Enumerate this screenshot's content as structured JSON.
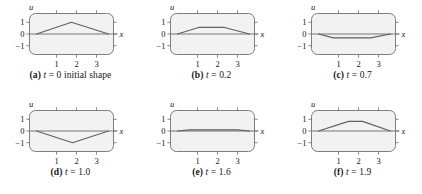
{
  "figure": {
    "title": "",
    "panel_count": 6,
    "columns": 3,
    "rows": 2
  },
  "axes": {
    "ylabel": "u",
    "xlabel": "x",
    "ytick_labels": [
      "1",
      "0",
      "−1"
    ],
    "ytick_values": [
      1,
      0,
      -1
    ],
    "xtick_labels": [
      "1",
      "2",
      "3"
    ],
    "xtick_values": [
      1,
      2,
      3
    ],
    "xlim": [
      -0.35,
      3.85
    ],
    "ylim": [
      -1.75,
      1.75
    ],
    "grid": false,
    "frame_fill": "#f2f2f2",
    "frame_stroke": "#6f6f72",
    "curve_color": "#5f5f63",
    "axis_color": "#77777a"
  },
  "panels": [
    {
      "id": "a",
      "label": "(a)",
      "caption_var": "t",
      "caption_value": "0",
      "caption_suffix": " initial shape",
      "caption_full": "(a) t = 0 initial shape",
      "time": 0
    },
    {
      "id": "b",
      "label": "(b)",
      "caption_var": "t",
      "caption_value": "0.2",
      "caption_suffix": "",
      "caption_full": "(b) t = 0.2",
      "time": 0.2
    },
    {
      "id": "c",
      "label": "(c)",
      "caption_var": "t",
      "caption_value": "0.7",
      "caption_suffix": "",
      "caption_full": "(c) t = 0.7",
      "time": 0.7
    },
    {
      "id": "d",
      "label": "(d)",
      "caption_var": "t",
      "caption_value": "1.0",
      "caption_suffix": "",
      "caption_full": "(d) t = 1.0",
      "time": 1.0
    },
    {
      "id": "e",
      "label": "(e)",
      "caption_var": "t",
      "caption_value": "1.6",
      "caption_suffix": "",
      "caption_full": "(e) t = 1.6",
      "time": 1.6
    },
    {
      "id": "f",
      "label": "(f)",
      "caption_var": "t",
      "caption_value": "1.9",
      "caption_suffix": "",
      "caption_full": "(f) t = 1.9",
      "time": 1.9
    }
  ],
  "chart_data": [
    {
      "type": "line",
      "panel": "a",
      "title": "(a) t = 0 initial shape",
      "xlabel": "x",
      "ylabel": "u",
      "xlim": [
        -0.35,
        3.85
      ],
      "ylim": [
        -1.75,
        1.75
      ],
      "grid": false,
      "series": [
        {
          "name": "u(x,0)",
          "x": [
            0.0,
            1.75,
            3.6
          ],
          "values": [
            0.0,
            1.0,
            0.0
          ]
        }
      ]
    },
    {
      "type": "line",
      "panel": "b",
      "title": "(b) t = 0.2",
      "xlabel": "x",
      "ylabel": "u",
      "xlim": [
        -0.35,
        3.85
      ],
      "ylim": [
        -1.75,
        1.75
      ],
      "grid": false,
      "series": [
        {
          "name": "u(x,0.2)",
          "x": [
            0.0,
            1.05,
            2.35,
            3.6
          ],
          "values": [
            0.0,
            0.56,
            0.56,
            0.0
          ]
        }
      ]
    },
    {
      "type": "line",
      "panel": "c",
      "title": "(c) t = 0.7",
      "xlabel": "x",
      "ylabel": "u",
      "xlim": [
        -0.35,
        3.85
      ],
      "ylim": [
        -1.75,
        1.75
      ],
      "grid": false,
      "series": [
        {
          "name": "u(x,0.7)",
          "x": [
            0.0,
            0.75,
            2.6,
            3.6
          ],
          "values": [
            0.0,
            -0.33,
            -0.33,
            0.0
          ]
        }
      ]
    },
    {
      "type": "line",
      "panel": "d",
      "title": "(d) t = 1.0",
      "xlabel": "x",
      "ylabel": "u",
      "xlim": [
        -0.35,
        3.85
      ],
      "ylim": [
        -1.75,
        1.75
      ],
      "grid": false,
      "series": [
        {
          "name": "u(x,1.0)",
          "x": [
            0.0,
            1.8,
            3.6
          ],
          "values": [
            0.0,
            -1.0,
            0.0
          ]
        }
      ]
    },
    {
      "type": "line",
      "panel": "e",
      "title": "(e) t = 1.6",
      "xlabel": "x",
      "ylabel": "u",
      "xlim": [
        -0.35,
        3.85
      ],
      "ylim": [
        -1.75,
        1.75
      ],
      "grid": false,
      "series": [
        {
          "name": "u(x,1.6)",
          "x": [
            0.0,
            0.6,
            3.0,
            3.6
          ],
          "values": [
            0.0,
            0.1,
            0.1,
            0.0
          ]
        }
      ]
    },
    {
      "type": "line",
      "panel": "f",
      "title": "(f) t = 1.9",
      "xlabel": "x",
      "ylabel": "u",
      "xlim": [
        -0.35,
        3.85
      ],
      "ylim": [
        -1.75,
        1.75
      ],
      "grid": false,
      "series": [
        {
          "name": "u(x,1.9)",
          "x": [
            0.0,
            1.5,
            2.2,
            3.6
          ],
          "values": [
            0.0,
            0.82,
            0.82,
            0.0
          ]
        }
      ]
    }
  ]
}
